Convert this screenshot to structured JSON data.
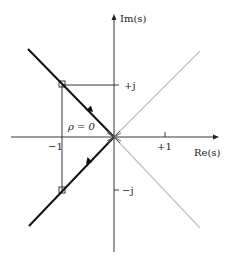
{
  "diagram": {
    "type": "root-locus",
    "axes": {
      "x_label": "Re(s)",
      "y_label": "Im(s)",
      "x_ticks": [
        {
          "value": -1,
          "label": "−1"
        },
        {
          "value": 1,
          "label": "+1"
        }
      ],
      "y_ticks": [
        {
          "value": 1,
          "label": "+j"
        },
        {
          "value": -1,
          "label": "−j"
        }
      ]
    },
    "annotations": {
      "rho_label": "ρ = 0"
    },
    "branches": [
      {
        "name": "upper-left",
        "style": "dark",
        "direction": "toward-origin"
      },
      {
        "name": "lower-left",
        "style": "dark",
        "direction": "away-from-origin"
      },
      {
        "name": "upper-right",
        "style": "light"
      },
      {
        "name": "lower-right",
        "style": "light"
      }
    ],
    "colors": {
      "axis": "#222222",
      "dark_branch": "#111111",
      "light_branch": "#c8c8c8"
    }
  }
}
